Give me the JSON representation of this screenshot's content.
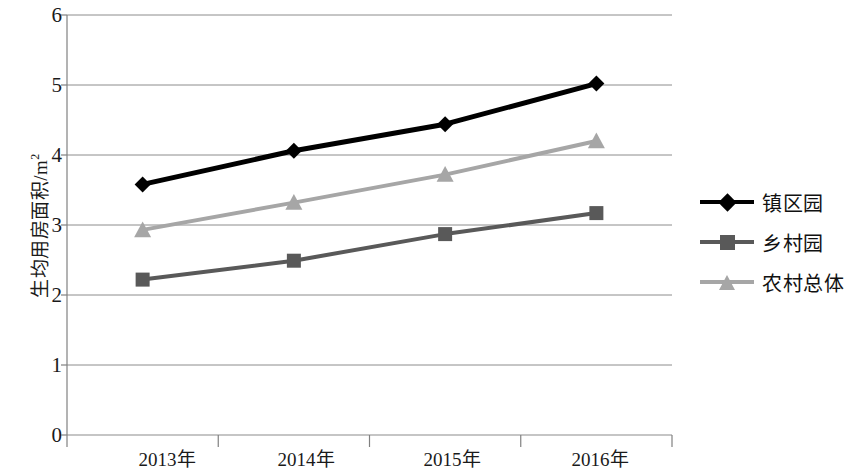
{
  "chart_data": {
    "type": "line",
    "title": "",
    "xlabel": "",
    "ylabel": "生均用房面积/m²",
    "categories": [
      "2013年",
      "2014年",
      "2015年",
      "2016年"
    ],
    "ylim": [
      0,
      6
    ],
    "yticks": [
      "0",
      "1",
      "2",
      "3",
      "4",
      "5",
      "6"
    ],
    "grid": true,
    "legend_position": "right",
    "series": [
      {
        "name": "镇区园",
        "values": [
          3.58,
          4.06,
          4.44,
          5.02
        ],
        "color": "#000000",
        "marker": "diamond"
      },
      {
        "name": "乡村园",
        "values": [
          2.22,
          2.49,
          2.87,
          3.17
        ],
        "color": "#595959",
        "marker": "square"
      },
      {
        "name": "农村总体",
        "values": [
          2.93,
          3.32,
          3.72,
          4.2
        ],
        "color": "#a6a6a6",
        "marker": "triangle"
      }
    ]
  },
  "axis": {
    "y_title": "生均用房面积/m",
    "y_title_exponent": "2",
    "tick_0": "0",
    "tick_1": "1",
    "tick_2": "2",
    "tick_3": "3",
    "tick_4": "4",
    "tick_5": "5",
    "tick_6": "6",
    "x_0": "2013年",
    "x_1": "2014年",
    "x_2": "2015年",
    "x_3": "2016年"
  },
  "legend": {
    "items": [
      {
        "label": "镇区园",
        "color": "#000000",
        "marker": "diamond"
      },
      {
        "label": "乡村园",
        "color": "#595959",
        "marker": "square"
      },
      {
        "label": "农村总体",
        "color": "#a6a6a6",
        "marker": "triangle"
      }
    ]
  },
  "colors": {
    "axis": "#808080",
    "grid": "#8c8c8c",
    "text": "#1a1a1a",
    "series_town": "#000000",
    "series_village": "#595959",
    "series_rural_total": "#a6a6a6"
  }
}
